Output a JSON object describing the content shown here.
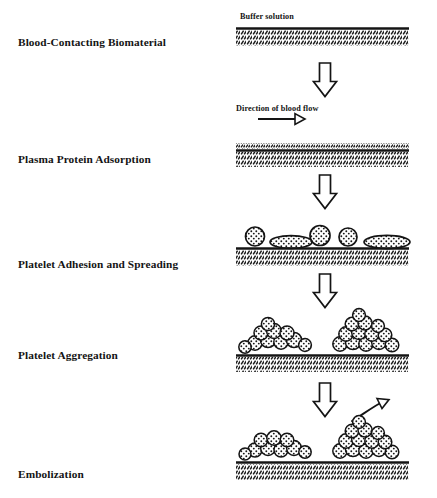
{
  "figure": {
    "title_present": false,
    "background_color": "#ffffff",
    "ink_color": "#141414",
    "stages": [
      {
        "id": "blood-contacting-biomaterial",
        "label": "Blood-Contacting Biomaterial",
        "label_y": 36,
        "graphic": "bare-hatched-substrate-with-buffer"
      },
      {
        "id": "plasma-protein-adsorption",
        "label": "Plasma Protein Adsorption",
        "label_y": 153,
        "graphic": "substrate-with-thin-protein-layer"
      },
      {
        "id": "platelet-adhesion-and-spreading",
        "label": "Platelet Adhesion and Spreading",
        "label_y": 258,
        "graphic": "substrate-with-round-and-spread-platelets"
      },
      {
        "id": "platelet-aggregation",
        "label": "Platelet Aggregation",
        "label_y": 349,
        "graphic": "substrate-with-platelet-aggregates"
      },
      {
        "id": "embolization",
        "label": "Embolization",
        "label_y": 468,
        "graphic": "substrate-with-aggregates-and-detaching-embolus"
      }
    ],
    "captions": [
      {
        "id": "buffer-solution",
        "text": "Buffer solution",
        "x": 240,
        "y": 12
      },
      {
        "id": "direction-of-blood-flow",
        "text": "Direction of blood flow",
        "x": 236,
        "y": 104
      }
    ],
    "arrows": {
      "down_arrow_count": 4,
      "down_arrow_label": "process step arrow",
      "flow_arrow_label": "blood flow direction arrow",
      "embolus_arrow_label": "embolus detachment arrow"
    },
    "colors": {
      "line": "#141414",
      "hatch": "#1a1a1a",
      "fill": "#ffffff"
    }
  }
}
